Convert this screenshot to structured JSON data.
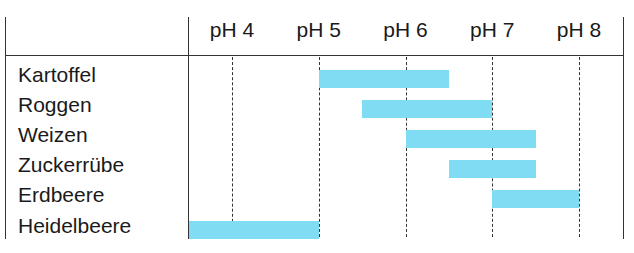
{
  "chart_data": {
    "type": "bar",
    "orientation": "horizontal-range",
    "title": "",
    "xlabel": "",
    "ylabel": "",
    "x_ticks": [
      "pH 4",
      "pH 5",
      "pH 6",
      "pH 7",
      "pH 8"
    ],
    "x_tick_values": [
      4,
      5,
      6,
      7,
      8
    ],
    "xlim": [
      3.5,
      8.5
    ],
    "grid": "vertical dashed",
    "bar_color": "#7fdcf2",
    "categories": [
      "Kartoffel",
      "Roggen",
      "Weizen",
      "Zuckerrübe",
      "Erdbeere",
      "Heidelbeere"
    ],
    "series": [
      {
        "name": "pH range",
        "ranges": [
          {
            "label": "Kartoffel",
            "start": 5.0,
            "end": 6.5
          },
          {
            "label": "Roggen",
            "start": 5.5,
            "end": 7.0
          },
          {
            "label": "Weizen",
            "start": 6.0,
            "end": 7.5
          },
          {
            "label": "Zuckerrübe",
            "start": 6.5,
            "end": 7.5
          },
          {
            "label": "Erdbeere",
            "start": 7.0,
            "end": 8.0
          },
          {
            "label": "Heidelbeere",
            "start": 3.5,
            "end": 5.0
          }
        ]
      }
    ]
  }
}
